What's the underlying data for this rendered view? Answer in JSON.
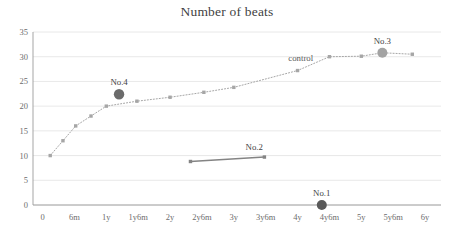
{
  "chart": {
    "title": "Number of beats"
  },
  "chart_data": {
    "type": "line",
    "title": "Number of beats",
    "xlabel": "",
    "ylabel": "",
    "grid": true,
    "legend_position": "inline-annotation",
    "x_tick_labels": [
      "0",
      "6m",
      "1y",
      "1y6m",
      "2y",
      "2y6m",
      "3y",
      "3y6m",
      "4y",
      "4y6m",
      "5y",
      "5y6m",
      "6y"
    ],
    "x_tick_values": [
      0,
      0.5,
      1,
      1.5,
      2,
      2.5,
      3,
      3.5,
      4,
      4.5,
      5,
      5.5,
      6
    ],
    "xlim": [
      -0.15,
      6.25
    ],
    "y_tick_labels": [
      "0",
      "5",
      "10",
      "15",
      "20",
      "25",
      "30",
      "35"
    ],
    "y_tick_values": [
      0,
      5,
      10,
      15,
      20,
      25,
      30,
      35
    ],
    "ylim": [
      0,
      35
    ],
    "series": [
      {
        "name": "control",
        "style": "dotted-line-with-markers",
        "color": "#a6a6a6",
        "annotation": "control",
        "annotation_x": 4.05,
        "annotation_y": 29.2,
        "x": [
          0.12,
          0.32,
          0.52,
          0.76,
          1.0,
          1.48,
          2.0,
          2.53,
          3.0,
          4.0,
          4.5,
          5.0,
          5.33,
          5.8
        ],
        "y": [
          10.0,
          13.0,
          16.0,
          18.0,
          20.0,
          21.0,
          21.8,
          22.8,
          23.8,
          27.2,
          30.0,
          30.1,
          30.8,
          30.5
        ]
      },
      {
        "name": "No.2",
        "style": "solid-line-with-markers",
        "color": "#848484",
        "x": [
          2.32,
          3.48
        ],
        "y": [
          8.8,
          9.7
        ]
      }
    ],
    "highlight_points": [
      {
        "label": "No.1",
        "x": 4.38,
        "y": 0.0,
        "color": "#595959",
        "radius": 5.0,
        "label_dy": -9
      },
      {
        "label": "No.3",
        "x": 5.33,
        "y": 30.8,
        "color": "#a3a3a3",
        "radius": 5.0,
        "label_dy": -9
      },
      {
        "label": "No.4",
        "x": 1.2,
        "y": 22.4,
        "color": "#6b6b6b",
        "radius": 5.2,
        "label_dy": -9
      }
    ],
    "segment_labels": [
      {
        "label": "No.2",
        "x": 3.32,
        "y": 11.2
      }
    ],
    "colors": {
      "control_line": "#a6a6a6",
      "no2_line": "#848484",
      "grid": "#e2e2e2",
      "axis": "#9b9b9b",
      "text": "#5a5a5a",
      "title": "#3f3f3f"
    }
  }
}
